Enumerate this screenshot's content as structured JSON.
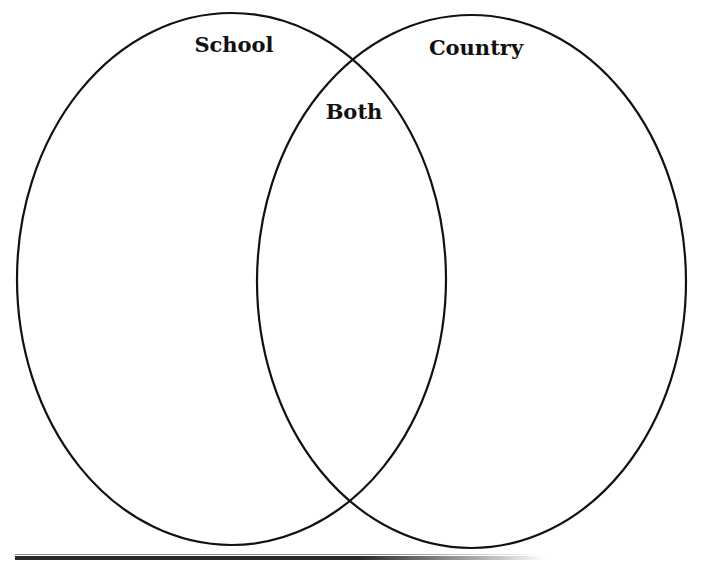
{
  "diagram": {
    "type": "venn",
    "sets": [
      {
        "id": "school",
        "label": "School",
        "cx": 231.5,
        "cy": 279,
        "rx": 214.5,
        "ry": 266
      },
      {
        "id": "country",
        "label": "Country",
        "cx": 471.5,
        "cy": 281.5,
        "rx": 214.5,
        "ry": 266.5
      }
    ],
    "intersection": {
      "label": "Both"
    },
    "stroke_color": "#111111"
  }
}
